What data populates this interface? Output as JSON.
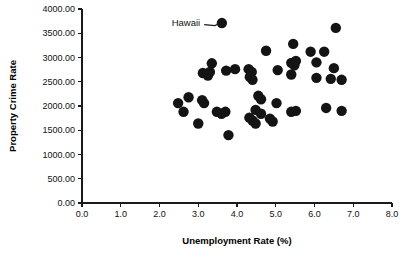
{
  "chart_data": {
    "type": "scatter",
    "title": "",
    "xlabel": "Unemployment Rate (%)",
    "ylabel": "Property Crime Rate",
    "xlim": [
      0.0,
      8.0
    ],
    "ylim": [
      0.0,
      4000.0
    ],
    "grid": false,
    "legend": null,
    "xticks": [
      "0.0",
      "1.0",
      "2.0",
      "3.0",
      "4.0",
      "5.0",
      "6.0",
      "7.0",
      "8.0"
    ],
    "xtick_values": [
      0.0,
      1.0,
      2.0,
      3.0,
      4.0,
      5.0,
      6.0,
      7.0,
      8.0
    ],
    "yticks": [
      "0.00",
      "500.00",
      "1000.00",
      "1500.00",
      "2000.00",
      "2500.00",
      "3000.00",
      "3500.00",
      "4000.00"
    ],
    "ytick_values": [
      0,
      500,
      1000,
      1500,
      2000,
      2500,
      3000,
      3500,
      4000
    ],
    "marker": "filled-circle",
    "marker_color": "#141414",
    "marker_size": 5.2,
    "annotations": [
      {
        "label": "Hawaii",
        "text_x": 3.05,
        "text_y": 3730,
        "point_x": 3.61,
        "point_y": 3710
      }
    ],
    "points": [
      {
        "x": 3.61,
        "y": 3710
      },
      {
        "x": 6.55,
        "y": 3610
      },
      {
        "x": 5.45,
        "y": 3280
      },
      {
        "x": 4.75,
        "y": 3140
      },
      {
        "x": 5.9,
        "y": 3120
      },
      {
        "x": 6.25,
        "y": 3120
      },
      {
        "x": 3.35,
        "y": 2880
      },
      {
        "x": 5.4,
        "y": 2890
      },
      {
        "x": 5.52,
        "y": 2930
      },
      {
        "x": 5.48,
        "y": 2840
      },
      {
        "x": 6.05,
        "y": 2900
      },
      {
        "x": 6.5,
        "y": 2780
      },
      {
        "x": 4.3,
        "y": 2760
      },
      {
        "x": 4.38,
        "y": 2700
      },
      {
        "x": 5.05,
        "y": 2740
      },
      {
        "x": 5.4,
        "y": 2650
      },
      {
        "x": 3.95,
        "y": 2760
      },
      {
        "x": 3.72,
        "y": 2730
      },
      {
        "x": 3.12,
        "y": 2680
      },
      {
        "x": 3.25,
        "y": 2630
      },
      {
        "x": 3.3,
        "y": 2700
      },
      {
        "x": 4.33,
        "y": 2600
      },
      {
        "x": 4.4,
        "y": 2540
      },
      {
        "x": 6.05,
        "y": 2580
      },
      {
        "x": 6.42,
        "y": 2560
      },
      {
        "x": 6.7,
        "y": 2540
      },
      {
        "x": 2.75,
        "y": 2180
      },
      {
        "x": 2.48,
        "y": 2060
      },
      {
        "x": 3.1,
        "y": 2120
      },
      {
        "x": 3.15,
        "y": 2060
      },
      {
        "x": 4.55,
        "y": 2210
      },
      {
        "x": 4.62,
        "y": 2140
      },
      {
        "x": 5.02,
        "y": 2060
      },
      {
        "x": 6.3,
        "y": 1960
      },
      {
        "x": 2.62,
        "y": 1880
      },
      {
        "x": 3.48,
        "y": 1880
      },
      {
        "x": 3.6,
        "y": 1840
      },
      {
        "x": 3.7,
        "y": 1880
      },
      {
        "x": 4.48,
        "y": 1920
      },
      {
        "x": 4.62,
        "y": 1840
      },
      {
        "x": 5.4,
        "y": 1880
      },
      {
        "x": 5.52,
        "y": 1900
      },
      {
        "x": 6.7,
        "y": 1900
      },
      {
        "x": 4.32,
        "y": 1760
      },
      {
        "x": 4.4,
        "y": 1700
      },
      {
        "x": 4.85,
        "y": 1740
      },
      {
        "x": 4.92,
        "y": 1680
      },
      {
        "x": 4.48,
        "y": 1640
      },
      {
        "x": 3.0,
        "y": 1640
      },
      {
        "x": 3.78,
        "y": 1400
      }
    ]
  },
  "figure": {
    "width": 409,
    "height": 257,
    "background": "#ffffff",
    "foreground": "#111111"
  }
}
